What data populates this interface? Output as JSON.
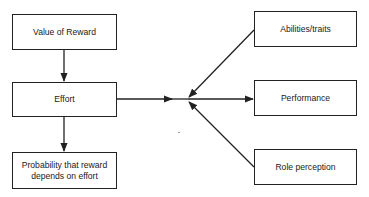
{
  "diagram": {
    "nodes": {
      "value_of_reward": "Value of Reward",
      "effort": "Effort",
      "probability": "Probability that reward depends on effort",
      "abilities": "Abilities/traits",
      "performance": "Performance",
      "role_perception": "Role perception"
    },
    "edges": [
      {
        "from": "Value of Reward",
        "to": "Effort"
      },
      {
        "from": "Effort",
        "to": "Probability that reward depends on effort"
      },
      {
        "from": "Effort",
        "to": "junction"
      },
      {
        "from": "Abilities/traits",
        "to": "junction"
      },
      {
        "from": "Role perception",
        "to": "junction"
      },
      {
        "from": "junction",
        "to": "Performance"
      }
    ],
    "colors": {
      "stroke": "#222222",
      "background": "#ffffff"
    }
  }
}
